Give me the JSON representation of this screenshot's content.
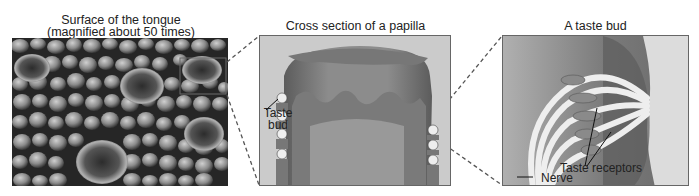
{
  "figure": {
    "panels": [
      {
        "id": "surface",
        "title_line1": "Surface of the tongue",
        "title_line2": "(magnified about 50 times)",
        "image": "micrograph-tongue-surface"
      },
      {
        "id": "papilla",
        "title": "Cross section of a papilla",
        "labels": {
          "taste_bud_line1": "Taste",
          "taste_bud_line2": "bud"
        }
      },
      {
        "id": "taste-bud",
        "title": "A taste bud",
        "labels": {
          "taste_receptors": "Taste receptors",
          "nerve": "Nerve"
        }
      }
    ],
    "colors": {
      "panel_bg": "#c9c9c9",
      "tissue_dark": "#5a5a5a",
      "tissue_mid": "#8a8a8a",
      "highlight": "#eeeeee",
      "dashed_connector": "#555555"
    }
  }
}
